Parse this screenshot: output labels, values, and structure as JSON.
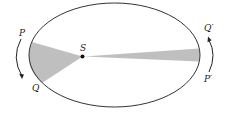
{
  "diagram": {
    "labels": {
      "sun": "S",
      "p": "P",
      "q": "Q",
      "p_prime": "P′",
      "q_prime": "Q′"
    },
    "colors": {
      "orbit": "#333333",
      "sector_fill": "#b8b8b8",
      "sun": "#111111",
      "arrow": "#222222",
      "background": "#ffffff"
    }
  }
}
